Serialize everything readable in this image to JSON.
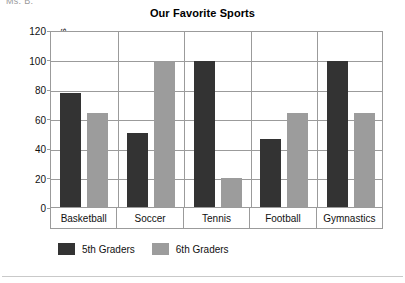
{
  "page": {
    "header_fragment": "Ms. B."
  },
  "chart_data": {
    "type": "bar",
    "title": "Our Favorite Sports",
    "xlabel": "",
    "ylabel": "Number of Students",
    "ylim": [
      0,
      120
    ],
    "yticks": [
      0,
      20,
      40,
      60,
      80,
      100,
      120
    ],
    "grid": true,
    "legend_position": "bottom",
    "categories": [
      "Basketball",
      "Soccer",
      "Tennis",
      "Football",
      "Gymnastics"
    ],
    "series": [
      {
        "name": "5th Graders",
        "color": "#333333",
        "values": [
          77,
          50,
          99,
          46,
          99
        ]
      },
      {
        "name": "6th Graders",
        "color": "#9c9c9c",
        "values": [
          64,
          98,
          20,
          64,
          64
        ]
      }
    ]
  }
}
